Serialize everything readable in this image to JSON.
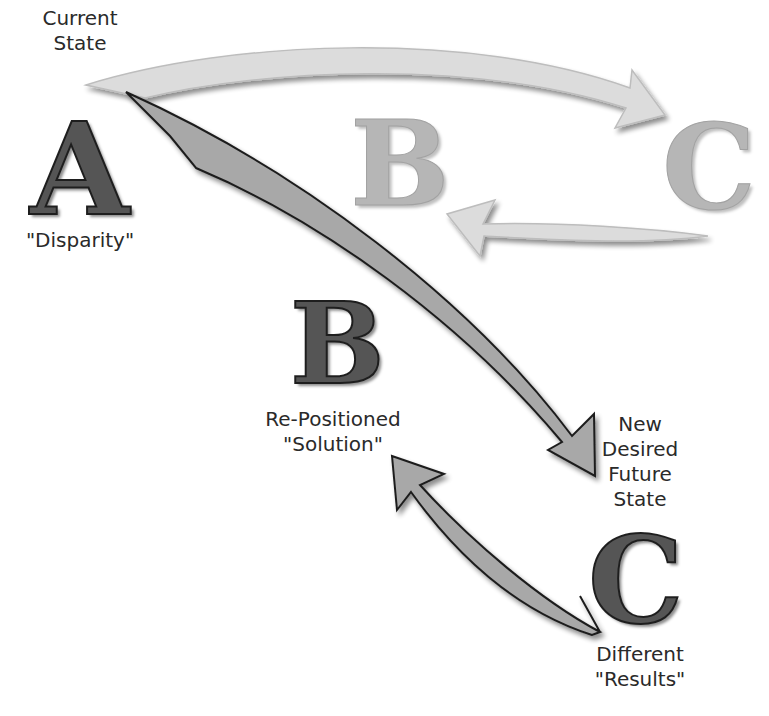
{
  "labels": {
    "current_state": [
      "Current",
      "State"
    ],
    "disparity": "\"Disparity\"",
    "repositioned": [
      "Re-Positioned",
      "\"Solution\""
    ],
    "new_desired": [
      "New",
      "Desired",
      "Future",
      "State"
    ],
    "different_results": [
      "Different",
      "\"Results\""
    ]
  },
  "letters": {
    "a": "A",
    "b_original": "B",
    "c_original": "C",
    "b_new": "B",
    "c_new": "C"
  },
  "colors": {
    "dark_letter": "#555555",
    "ghost_letter": "#b6b6b6",
    "arrow_dark_fill": "#a8a8a8",
    "arrow_light_fill": "#dcdcdc",
    "text": "#2a2a2a"
  }
}
